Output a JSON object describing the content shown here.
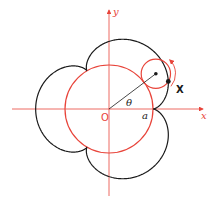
{
  "figure": {
    "labels": {
      "x_axis": "x",
      "y_axis": "y",
      "origin": "O",
      "radius": "a",
      "angle": "θ",
      "point": "X"
    },
    "colors": {
      "axes": "#e8443a",
      "fixed_circle": "#e8443a",
      "rolling_circle": "#e8443a",
      "curve": "#1a1a1a",
      "radius_line": "#1a1a1a",
      "rotation_arrow": "#e8443a"
    },
    "geometry": {
      "origin_px": [
        109,
        109
      ],
      "fixed_radius_px": 44,
      "rolling_radius_px": 14.67,
      "cusps": 3,
      "rolling_center_angle_deg": 37
    }
  }
}
